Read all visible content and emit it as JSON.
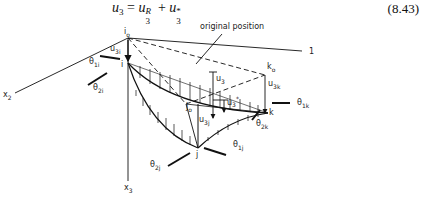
{
  "equation": {
    "lhs": "u",
    "lhs_sub": "3",
    "equals": "=",
    "term1": "u",
    "term1_sup": "R",
    "term1_sub": "3",
    "plus": "+",
    "term2": "u",
    "term2_sup": "*",
    "term2_sub": "3",
    "number": "(8.43)"
  },
  "diagram": {
    "annotation": "original position",
    "axes": {
      "x1": "1",
      "x2_base": "x",
      "x2_sub": "2",
      "x3_base": "x",
      "x3_sub": "3"
    },
    "nodes": {
      "i0": "i",
      "i0_sub": "o",
      "i": "i",
      "j0": "j",
      "j0_sub": "o",
      "j": "j",
      "k0": "k",
      "k0_sub": "o",
      "k": "k"
    },
    "labels": {
      "u3i": {
        "base": "u",
        "sub": "3i"
      },
      "u3j": {
        "base": "u",
        "sub": "3j"
      },
      "u3k": {
        "base": "u",
        "sub": "3k"
      },
      "u3": {
        "base": "u",
        "sub": "3"
      },
      "u3star": {
        "base": "u",
        "sub": "3",
        "sup": "*"
      },
      "theta1i": {
        "base": "θ",
        "sub": "1i"
      },
      "theta2i": {
        "base": "θ",
        "sub": "2i"
      },
      "theta1j": {
        "base": "θ",
        "sub": "1j"
      },
      "theta2j": {
        "base": "θ",
        "sub": "2j"
      },
      "theta1k": {
        "base": "θ",
        "sub": "1k"
      },
      "theta2k": {
        "base": "θ",
        "sub": "2k"
      }
    }
  }
}
